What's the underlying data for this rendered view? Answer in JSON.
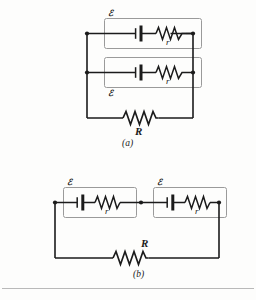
{
  "figure": {
    "background_color": "#fdfdfc",
    "wire_color": "#1b1b1b",
    "cell_box_color": "#9a9a9a",
    "node_color": "#1b1b1b"
  },
  "circuit_a": {
    "caption": "(a)",
    "description": "Two identical cells connected in parallel across resistor R",
    "cells": [
      {
        "emf_label": "ℰ",
        "emf_label_position": "top-left",
        "internal_resistance_label": "r",
        "battery_icon": "battery-cell-icon",
        "resistor_icon": "resistor-zigzag-icon"
      },
      {
        "emf_label": "ℰ",
        "emf_label_position": "bottom-left",
        "internal_resistance_label": "r",
        "battery_icon": "battery-cell-icon",
        "resistor_icon": "resistor-zigzag-icon"
      }
    ],
    "load": {
      "label": "R",
      "label_position": "below",
      "resistor_icon": "resistor-zigzag-icon"
    },
    "nodes": 4
  },
  "circuit_b": {
    "caption": "(b)",
    "description": "Two identical cells connected in series across resistor R",
    "cells": [
      {
        "emf_label": "ℰ",
        "emf_label_position": "top-left",
        "internal_resistance_label": "r",
        "battery_icon": "battery-cell-icon",
        "resistor_icon": "resistor-zigzag-icon"
      },
      {
        "emf_label": "ℰ",
        "emf_label_position": "top-left",
        "internal_resistance_label": "r",
        "battery_icon": "battery-cell-icon",
        "resistor_icon": "resistor-zigzag-icon"
      }
    ],
    "load": {
      "label": "R",
      "label_position": "above",
      "resistor_icon": "resistor-zigzag-icon"
    },
    "nodes": 3
  }
}
